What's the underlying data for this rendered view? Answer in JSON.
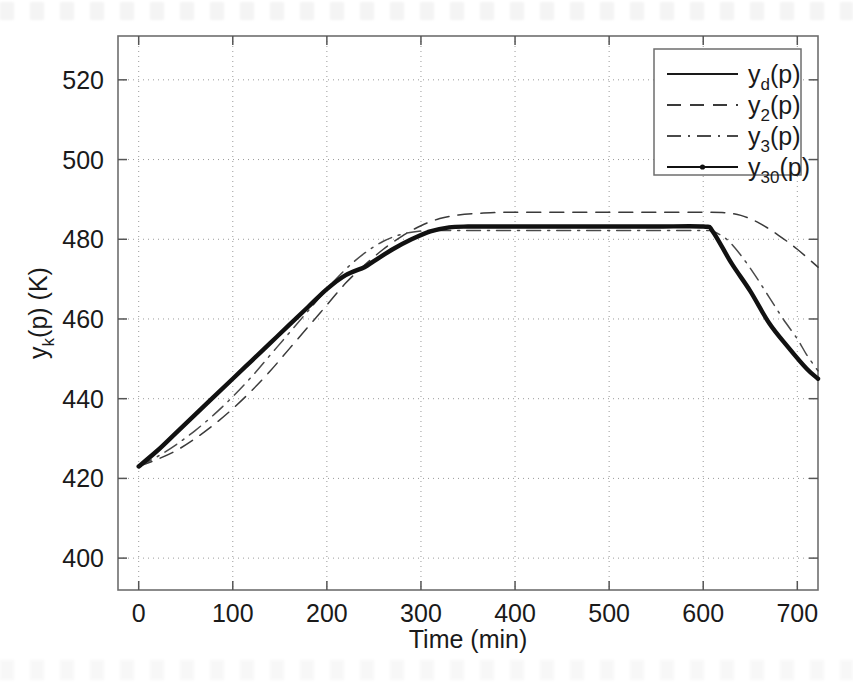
{
  "chart_data": {
    "type": "line",
    "title": "",
    "xlabel": "Time (min)",
    "ylabel": "y_k(p) (K)",
    "ylabel_parts": {
      "base": "y",
      "sub": "k",
      "rest": "(p) (K)"
    },
    "xlim": [
      -22,
      722
    ],
    "ylim": [
      392,
      531
    ],
    "xticks": [
      0,
      100,
      200,
      300,
      400,
      500,
      600,
      700
    ],
    "xtick_labels": [
      "0",
      "100",
      "200",
      "300",
      "400",
      "500",
      "600",
      "700"
    ],
    "yticks": [
      400,
      420,
      440,
      460,
      480,
      500,
      520
    ],
    "ytick_labels": [
      "400",
      "420",
      "440",
      "460",
      "480",
      "500",
      "520"
    ],
    "grid": true,
    "grid_style": "dotted",
    "legend_position": "top-right",
    "series": [
      {
        "name": "y_d(p)",
        "label_base": "y",
        "label_sub": "d",
        "label_rest": "(p)",
        "style": "solid",
        "color": "#1a1a1a",
        "width": 1.6,
        "x": [
          0,
          20,
          40,
          60,
          80,
          100,
          120,
          140,
          160,
          180,
          200,
          220,
          240,
          250,
          270,
          290,
          310,
          330,
          350,
          370,
          400,
          450,
          500,
          550,
          600,
          610,
          630,
          650,
          670,
          690,
          710,
          722
        ],
        "y": [
          423,
          427,
          431.5,
          436,
          440.5,
          445,
          449.5,
          454,
          458.5,
          463,
          467.5,
          471,
          473,
          474.5,
          477.5,
          480,
          482,
          483,
          483.2,
          483.2,
          483.2,
          483.2,
          483.2,
          483.2,
          483.2,
          482,
          474,
          467,
          459,
          453,
          447.5,
          445
        ]
      },
      {
        "name": "y_2(p)",
        "label_base": "y",
        "label_sub": "2",
        "label_rest": "(p)",
        "style": "dashed",
        "color": "#3a3a3a",
        "width": 1.5,
        "x": [
          0,
          20,
          40,
          60,
          80,
          100,
          120,
          140,
          160,
          180,
          200,
          220,
          240,
          260,
          280,
          300,
          320,
          340,
          360,
          380,
          400,
          450,
          500,
          550,
          600,
          620,
          640,
          660,
          680,
          700,
          722
        ],
        "y": [
          423,
          424.8,
          427,
          430,
          433.5,
          437.5,
          442,
          447,
          452.5,
          458,
          463.5,
          469,
          473.5,
          477.5,
          480.8,
          483.4,
          485.2,
          486.1,
          486.5,
          486.7,
          486.8,
          486.8,
          486.8,
          486.8,
          486.8,
          486.7,
          486,
          484,
          481,
          477.5,
          473
        ]
      },
      {
        "name": "y_3(p)",
        "label_base": "y",
        "label_sub": "3",
        "label_rest": "(p)",
        "style": "dashdot",
        "color": "#4a4a4a",
        "width": 1.5,
        "x": [
          0,
          20,
          40,
          60,
          80,
          100,
          120,
          140,
          160,
          180,
          200,
          220,
          240,
          260,
          280,
          300,
          320,
          340,
          360,
          400,
          450,
          500,
          550,
          600,
          610,
          625,
          640,
          655,
          670,
          685,
          700,
          710,
          722
        ],
        "y": [
          423,
          425.5,
          428.5,
          432,
          436,
          440.5,
          445.5,
          451,
          456.5,
          462,
          467.5,
          472.5,
          476.5,
          479.5,
          481.3,
          482.1,
          482.2,
          482.2,
          482.2,
          482.2,
          482.2,
          482.2,
          482.2,
          482.2,
          482,
          480,
          476,
          471,
          465.5,
          460,
          455,
          451,
          447
        ]
      },
      {
        "name": "y_30(p)",
        "label_base": "y",
        "label_sub": "30",
        "label_rest": "(p)",
        "style": "solid-marker",
        "color": "#111111",
        "width": 4.4,
        "x": [
          0,
          20,
          40,
          60,
          80,
          100,
          120,
          140,
          160,
          180,
          200,
          220,
          240,
          250,
          270,
          290,
          310,
          330,
          350,
          370,
          400,
          450,
          500,
          550,
          600,
          610,
          630,
          650,
          670,
          690,
          710,
          722
        ],
        "y": [
          423,
          427,
          431.5,
          436,
          440.5,
          445,
          449.5,
          454,
          458.5,
          463,
          467.5,
          471,
          473,
          474.5,
          477.5,
          480,
          482,
          483,
          483.2,
          483.2,
          483.2,
          483.2,
          483.2,
          483.2,
          483.2,
          482,
          474,
          467,
          459,
          453,
          447.5,
          445
        ]
      }
    ]
  }
}
